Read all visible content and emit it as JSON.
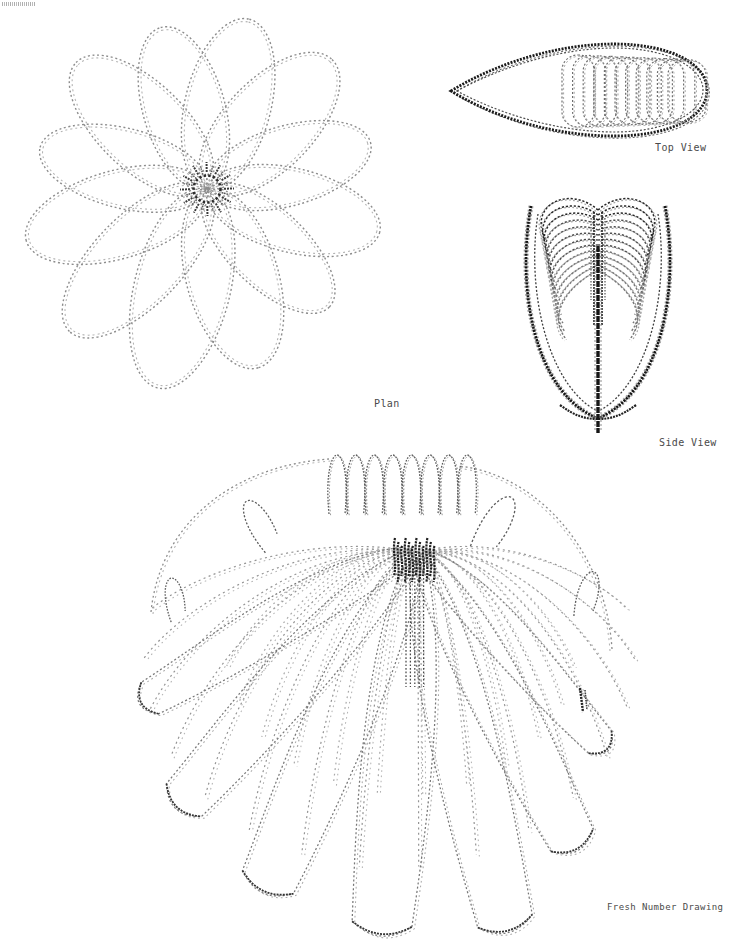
{
  "page": {
    "width": 732,
    "height": 947,
    "bg": "#ffffff"
  },
  "labels": {
    "plan": "Plan",
    "top": "Top View",
    "side": "Side View",
    "iso": "Fresh Number Drawing"
  },
  "palette": {
    "ink_dark": "#1b1b1b",
    "ink_mid": "#505050",
    "ink_soft": "#8d8d8d",
    "ink_faint": "#b4b4b4",
    "label_color": "#4a4a4a",
    "bg": "#ffffff"
  },
  "figures": {
    "plan": {
      "cx": 207,
      "cy": 189,
      "petal_count": 12,
      "rot_deg": 14,
      "petal_lengths": [
        178,
        170,
        186,
        205,
        198,
        188,
        172,
        182,
        168,
        175,
        180,
        170
      ],
      "petal_widths": [
        84,
        78,
        92,
        96,
        90,
        88,
        80,
        88,
        82,
        86,
        90,
        80
      ],
      "core_radius": 13.5,
      "tick_count": 12
    },
    "top": {
      "tip": [
        451,
        91
      ],
      "right_end": [
        707,
        90
      ],
      "top_y": 44,
      "bottom_y": 136,
      "rib_count": 11
    },
    "side": {
      "stem_x": 598,
      "stem_top": 246,
      "stem_bottom": 433,
      "arc_count": 13,
      "u_top_y": 206,
      "u_half_width": 67,
      "u_bottom_y": 419
    },
    "iso": {
      "center": [
        417,
        552
      ],
      "stem_line_count": 5,
      "stem_bottom": 687,
      "scallop_count": 8,
      "front_tips": [
        [
          150,
          698,
          18
        ],
        [
          184,
          800,
          24
        ],
        [
          268,
          882,
          28
        ],
        [
          382,
          924,
          30
        ],
        [
          505,
          921,
          28
        ],
        [
          572,
          840,
          24
        ],
        [
          600,
          742,
          16
        ]
      ],
      "hooks": [
        [
          258,
          522,
          -32,
          1.25
        ],
        [
          174,
          597,
          -12,
          1.0
        ],
        [
          497,
          521,
          28,
          1.45
        ],
        [
          588,
          592,
          12,
          1.1
        ]
      ]
    }
  }
}
